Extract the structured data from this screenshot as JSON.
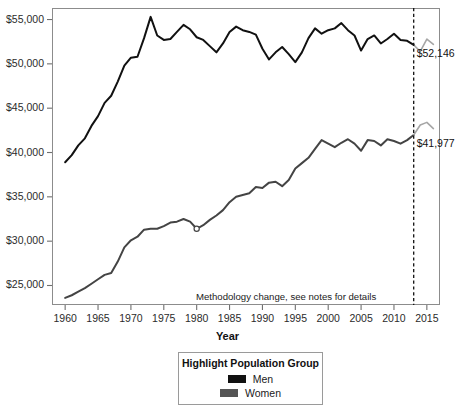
{
  "chart_data": {
    "type": "line",
    "title": "",
    "xlabel": "Year",
    "ylabel": "",
    "xlim": [
      1958,
      2017
    ],
    "ylim": [
      22800,
      56300
    ],
    "grid": false,
    "x_ticks": [
      1960,
      1965,
      1970,
      1975,
      1980,
      1985,
      1990,
      1995,
      2000,
      2005,
      2010,
      2015
    ],
    "x_tick_labels": [
      "1960",
      "1965",
      "1970",
      "1975",
      "1980",
      "1985",
      "1990",
      "1995",
      "2000",
      "2005",
      "2010",
      "2015"
    ],
    "y_ticks": [
      25000,
      30000,
      35000,
      40000,
      45000,
      50000,
      55000
    ],
    "y_tick_labels": [
      "$25,000",
      "$30,000",
      "$35,000",
      "$40,000",
      "$45,000",
      "$50,000",
      "$55,000"
    ],
    "legend_position": "below-plot",
    "annotations": [
      {
        "name": "methodology-note",
        "text": "Methodology change, see notes for details",
        "x": 2006,
        "y": 23700
      },
      {
        "name": "men-end-label",
        "text": "$52,146",
        "x": 2013,
        "y": 52146
      },
      {
        "name": "women-end-label",
        "text": "$41,977",
        "x": 2013,
        "y": 41977
      }
    ],
    "vertical_reference_line": {
      "x": 2013,
      "style": "dashed",
      "color": "#111111"
    },
    "series": [
      {
        "name": "Men",
        "color": "#111111",
        "highlight": true,
        "x": [
          1960,
          1961,
          1962,
          1963,
          1964,
          1965,
          1966,
          1967,
          1968,
          1969,
          1970,
          1971,
          1972,
          1973,
          1974,
          1975,
          1976,
          1977,
          1978,
          1979,
          1980,
          1981,
          1982,
          1983,
          1984,
          1985,
          1986,
          1987,
          1988,
          1989,
          1990,
          1991,
          1992,
          1993,
          1994,
          1995,
          1996,
          1997,
          1998,
          1999,
          2000,
          2001,
          2002,
          2003,
          2004,
          2005,
          2006,
          2007,
          2008,
          2009,
          2010,
          2011,
          2012,
          2013
        ],
        "values": [
          38900,
          39700,
          40800,
          41600,
          43000,
          44100,
          45600,
          46400,
          48000,
          49800,
          50700,
          50800,
          52900,
          55300,
          53200,
          52700,
          52800,
          53600,
          54400,
          53900,
          53000,
          52700,
          52000,
          51300,
          52300,
          53600,
          54200,
          53800,
          53600,
          53300,
          51700,
          50500,
          51300,
          51900,
          51100,
          50200,
          51300,
          52900,
          54000,
          53400,
          53800,
          54000,
          54600,
          53800,
          53200,
          51500,
          52800,
          53200,
          52300,
          52800,
          53400,
          52700,
          52600,
          52146
        ]
      },
      {
        "name": "Men (post-methodology-change)",
        "color": "#a6a6a6",
        "highlight": false,
        "x": [
          2013,
          2014,
          2015,
          2016
        ],
        "values": [
          52146,
          51400,
          52800,
          52200
        ]
      },
      {
        "name": "Women",
        "color": "#444444",
        "highlight": true,
        "x": [
          1960,
          1961,
          1962,
          1963,
          1964,
          1965,
          1966,
          1967,
          1968,
          1969,
          1970,
          1971,
          1972,
          1973,
          1974,
          1975,
          1976,
          1977,
          1978,
          1979,
          1980,
          1981,
          1982,
          1983,
          1984,
          1985,
          1986,
          1987,
          1988,
          1989,
          1990,
          1991,
          1992,
          1993,
          1994,
          1995,
          1996,
          1997,
          1998,
          1999,
          2000,
          2001,
          2002,
          2003,
          2004,
          2005,
          2006,
          2007,
          2008,
          2009,
          2010,
          2011,
          2012,
          2013
        ],
        "values": [
          23600,
          23900,
          24300,
          24700,
          25200,
          25700,
          26200,
          26400,
          27700,
          29300,
          30100,
          30500,
          31300,
          31400,
          31400,
          31700,
          32100,
          32200,
          32500,
          32200,
          31400,
          31800,
          32400,
          32900,
          33500,
          34400,
          35000,
          35200,
          35400,
          36100,
          36000,
          36600,
          36700,
          36200,
          36900,
          38200,
          38800,
          39400,
          40400,
          41400,
          41000,
          40600,
          41100,
          41500,
          41000,
          40200,
          41400,
          41300,
          40800,
          41500,
          41300,
          41000,
          41400,
          41977
        ]
      },
      {
        "name": "Women (post-methodology-change)",
        "color": "#a6a6a6",
        "highlight": false,
        "x": [
          2013,
          2014,
          2015,
          2016
        ],
        "values": [
          41977,
          43100,
          43400,
          42700
        ]
      }
    ]
  },
  "axis": {
    "x_title": "Year"
  },
  "legend": {
    "title": "Highlight Population Group",
    "items": [
      {
        "label": "Men",
        "color": "#111111"
      },
      {
        "label": "Women",
        "color": "#555555"
      }
    ]
  }
}
